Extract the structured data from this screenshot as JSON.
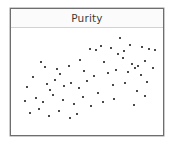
{
  "panel": {
    "title": "Purity",
    "border_color": "#6e6e6e",
    "background_color": "#ffffff",
    "header_background": "#fbfbfb",
    "header_divider_color": "#d2d2d2"
  },
  "chart_data": {
    "type": "scatter",
    "title": "Purity",
    "xlabel": "",
    "ylabel": "",
    "xlim": [
      0,
      100
    ],
    "ylim": [
      0,
      100
    ],
    "grid": false,
    "legend": null,
    "marker": {
      "shape": "square",
      "color": "#4a4a4a",
      "size_px": 2
    },
    "n_points": 62,
    "series": [
      {
        "name": "points",
        "color": "#4a4a4a",
        "x": [
          73.5,
          60.0,
          56.5,
          67.0,
          76.0,
          80.5,
          52.0,
          45.0,
          71.5,
          88.5,
          93.5,
          98.0,
          17.5,
          20.5,
          29.0,
          37.5,
          48.0,
          62.0,
          75.0,
          82.0,
          86.0,
          90.5,
          96.5,
          12.0,
          31.0,
          27.5,
          55.0,
          65.0,
          70.5,
          79.0,
          84.0,
          88.0,
          92.0,
          8.0,
          21.5,
          24.0,
          34.0,
          39.0,
          44.5,
          50.0,
          58.0,
          68.5,
          77.0,
          85.0,
          91.0,
          6.0,
          14.0,
          19.0,
          26.0,
          33.0,
          41.0,
          47.0,
          53.0,
          61.0,
          69.0,
          83.0,
          10.0,
          16.0,
          23.0,
          30.0,
          38.0,
          43.0
        ],
        "y": [
          95.0,
          87.0,
          83.0,
          84.5,
          82.0,
          88.0,
          83.5,
          72.0,
          78.0,
          85.5,
          84.0,
          83.0,
          70.0,
          64.5,
          63.0,
          66.0,
          60.5,
          70.0,
          74.0,
          68.0,
          66.5,
          71.5,
          64.0,
          55.0,
          58.0,
          52.0,
          56.0,
          58.5,
          62.0,
          60.0,
          63.5,
          57.0,
          50.0,
          44.0,
          47.0,
          41.0,
          45.5,
          49.0,
          43.0,
          51.0,
          38.0,
          46.0,
          48.0,
          40.0,
          35.0,
          30.0,
          33.0,
          28.5,
          36.0,
          31.0,
          27.0,
          34.0,
          25.0,
          29.0,
          32.0,
          26.0,
          18.0,
          22.0,
          14.0,
          20.0,
          12.0,
          17.0
        ]
      }
    ]
  }
}
